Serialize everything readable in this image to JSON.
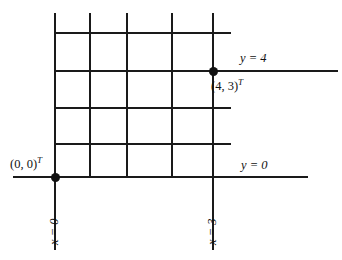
{
  "figure": {
    "type": "coordinate-grid-diagram",
    "background": "#ffffff",
    "ink_color": "#1a1a1a",
    "width": 342,
    "height": 260
  },
  "labels": {
    "origin_point": "(0, 0)",
    "origin_point_sup": "T",
    "data_point": "(4, 3)",
    "data_point_sup": "T",
    "y_equals_4": "y = 4",
    "y_equals_0": "y = 0",
    "x_equals_0": "x = 0",
    "x_equals_3": "x = 3"
  },
  "points": [
    {
      "name": "origin",
      "label": "(0, 0)",
      "superscript": "T",
      "x": 55,
      "y": 177
    },
    {
      "name": "data-point",
      "label": "(4, 3)",
      "superscript": "T",
      "x": 213,
      "y": 71
    }
  ],
  "grid": {
    "vertical_lines_x": [
      55,
      90,
      127,
      172,
      213
    ],
    "horizontal_lines_y": [
      33,
      71,
      108,
      144,
      177
    ],
    "grid_top": 13,
    "grid_bottom": 250,
    "grid_left": 13,
    "inner_right": 231,
    "axis_right_y4": 338,
    "axis_right_y0": 308
  }
}
